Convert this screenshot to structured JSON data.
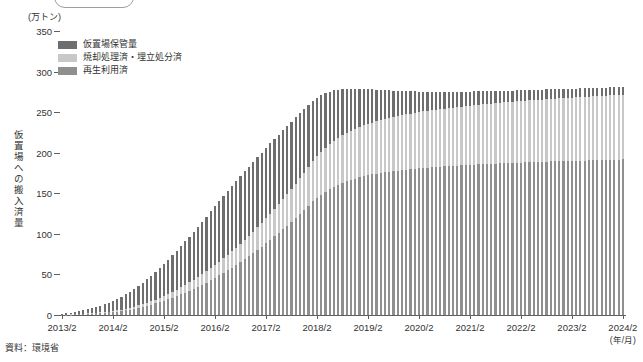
{
  "title_box": {
    "label": ""
  },
  "source_note": "資料：環境省",
  "axes": {
    "y_unit": "(万トン)",
    "y_title": "仮置場への搬入済量",
    "x_unit": "(年/月)",
    "y_ticks": [
      "0",
      "50",
      "100",
      "150",
      "200",
      "250",
      "300",
      "350"
    ],
    "x_ticks": [
      "2013/2",
      "2014/2",
      "2015/2",
      "2016/2",
      "2017/2",
      "2018/2",
      "2019/2",
      "2020/2",
      "2021/2",
      "2022/2",
      "2023/2",
      "2024/2"
    ]
  },
  "legend": {
    "items": [
      {
        "label": "仮置場保管量",
        "color": "#6e6e6e"
      },
      {
        "label": "焼却処理済・埋立処分済",
        "color": "#c8c8c8"
      },
      {
        "label": "再生利用済",
        "color": "#8f8f8f"
      }
    ]
  },
  "colors": {
    "storage": "#6e6e6e",
    "incinerated": "#c8c8c8",
    "recycled": "#8f8f8f",
    "axis": "#5f5f5f",
    "text": "#333333"
  },
  "chart_data": {
    "type": "bar",
    "stacked": true,
    "title": "",
    "xlabel": "(年/月)",
    "ylabel": "仮置場への搬入済量",
    "yunit": "万トン",
    "ylim": [
      0,
      350
    ],
    "ytick_step": 50,
    "grid": false,
    "legend_position": "top-left",
    "categories": [
      "2013/2",
      "2013/3",
      "2013/4",
      "2013/5",
      "2013/6",
      "2013/7",
      "2013/8",
      "2013/9",
      "2013/10",
      "2013/11",
      "2013/12",
      "2014/1",
      "2014/2",
      "2014/3",
      "2014/4",
      "2014/5",
      "2014/6",
      "2014/7",
      "2014/8",
      "2014/9",
      "2014/10",
      "2014/11",
      "2014/12",
      "2015/1",
      "2015/2",
      "2015/3",
      "2015/4",
      "2015/5",
      "2015/6",
      "2015/7",
      "2015/8",
      "2015/9",
      "2015/10",
      "2015/11",
      "2015/12",
      "2016/1",
      "2016/2",
      "2016/3",
      "2016/4",
      "2016/5",
      "2016/6",
      "2016/7",
      "2016/8",
      "2016/9",
      "2016/10",
      "2016/11",
      "2016/12",
      "2017/1",
      "2017/2",
      "2017/3",
      "2017/4",
      "2017/5",
      "2017/6",
      "2017/7",
      "2017/8",
      "2017/9",
      "2017/10",
      "2017/11",
      "2017/12",
      "2018/1",
      "2018/2",
      "2018/3",
      "2018/4",
      "2018/5",
      "2018/6",
      "2018/7",
      "2018/8",
      "2018/9",
      "2018/10",
      "2018/11",
      "2018/12",
      "2019/1",
      "2019/2",
      "2019/3",
      "2019/4",
      "2019/5",
      "2019/6",
      "2019/7",
      "2019/8",
      "2019/9",
      "2019/10",
      "2019/11",
      "2019/12",
      "2020/1",
      "2020/2",
      "2020/3",
      "2020/4",
      "2020/5",
      "2020/6",
      "2020/7",
      "2020/8",
      "2020/9",
      "2020/10",
      "2020/11",
      "2020/12",
      "2021/1",
      "2021/2",
      "2021/3",
      "2021/4",
      "2021/5",
      "2021/6",
      "2021/7",
      "2021/8",
      "2021/9",
      "2021/10",
      "2021/11",
      "2021/12",
      "2022/1",
      "2022/2",
      "2022/3",
      "2022/4",
      "2022/5",
      "2022/6",
      "2022/7",
      "2022/8",
      "2022/9",
      "2022/10",
      "2022/11",
      "2022/12",
      "2023/1",
      "2023/2",
      "2023/3",
      "2023/4",
      "2023/5",
      "2023/6",
      "2023/7",
      "2023/8",
      "2023/9",
      "2023/10",
      "2023/11",
      "2023/12",
      "2024/1",
      "2024/2"
    ],
    "series": [
      {
        "name": "再生利用済",
        "color": "#8f8f8f",
        "values": [
          0.3,
          0.4,
          0.5,
          0.7,
          0.9,
          1.1,
          1.4,
          1.7,
          2.0,
          2.4,
          2.8,
          3.2,
          3.7,
          4.3,
          5.0,
          5.8,
          6.7,
          7.7,
          8.8,
          10.0,
          11.3,
          12.7,
          14.2,
          15.8,
          17.5,
          19.3,
          21.2,
          23.2,
          25.3,
          27.5,
          29.8,
          32.2,
          34.7,
          37.3,
          40.0,
          42.8,
          45.7,
          48.7,
          51.8,
          55.0,
          58.3,
          61.7,
          65.2,
          68.8,
          72.5,
          76.3,
          80.2,
          84.2,
          88.3,
          92.5,
          96.8,
          101.2,
          105.7,
          110.3,
          115.0,
          119.8,
          124.7,
          129.7,
          134.8,
          140.0,
          144.5,
          148.5,
          152.0,
          155.2,
          158.0,
          160.5,
          162.8,
          164.8,
          166.6,
          168.2,
          169.6,
          170.9,
          172.1,
          173.2,
          174.2,
          175.1,
          175.9,
          176.7,
          177.4,
          178.1,
          178.7,
          179.3,
          179.8,
          180.3,
          180.8,
          181.3,
          181.7,
          182.1,
          182.5,
          182.9,
          183.2,
          183.6,
          183.9,
          184.2,
          184.5,
          184.8,
          185.1,
          185.4,
          185.6,
          185.9,
          186.1,
          186.4,
          186.6,
          186.8,
          187.1,
          187.3,
          187.5,
          187.7,
          187.9,
          188.1,
          188.3,
          188.5,
          188.6,
          188.8,
          189.0,
          189.2,
          189.3,
          189.5,
          189.7,
          189.8,
          190.0,
          190.1,
          190.3,
          190.4,
          190.6,
          190.7,
          190.9,
          191.0,
          191.1,
          191.3,
          191.4,
          191.5,
          191.7
        ]
      },
      {
        "name": "焼却処理済・埋立処分済",
        "color": "#c8c8c8",
        "values": [
          0.1,
          0.1,
          0.2,
          0.2,
          0.3,
          0.4,
          0.5,
          0.6,
          0.7,
          0.8,
          1.0,
          1.1,
          1.3,
          1.5,
          1.8,
          2.0,
          2.3,
          2.7,
          3.0,
          3.4,
          3.9,
          4.3,
          4.9,
          5.4,
          6.0,
          6.6,
          7.3,
          8.0,
          8.7,
          9.5,
          10.3,
          11.1,
          12.0,
          12.9,
          13.8,
          14.8,
          15.8,
          16.8,
          17.9,
          19.0,
          20.2,
          21.4,
          22.6,
          23.9,
          25.2,
          26.5,
          27.9,
          29.3,
          30.8,
          32.3,
          33.8,
          35.4,
          37.0,
          38.6,
          40.3,
          42.0,
          43.8,
          45.6,
          47.4,
          49.3,
          51.0,
          52.6,
          54.0,
          55.3,
          56.5,
          57.6,
          58.6,
          59.5,
          60.4,
          61.2,
          62.0,
          62.7,
          63.4,
          64.0,
          64.6,
          65.2,
          65.7,
          66.2,
          66.7,
          67.2,
          67.6,
          68.0,
          68.4,
          68.8,
          69.2,
          69.6,
          69.9,
          70.3,
          70.6,
          70.9,
          71.2,
          71.5,
          71.8,
          72.1,
          72.4,
          72.7,
          72.9,
          73.2,
          73.4,
          73.7,
          73.9,
          74.2,
          74.4,
          74.6,
          74.9,
          75.1,
          75.3,
          75.5,
          75.7,
          75.9,
          76.1,
          76.3,
          76.5,
          76.7,
          76.9,
          77.0,
          77.2,
          77.4,
          77.6,
          77.7,
          77.9,
          78.1,
          78.2,
          78.4,
          78.5,
          78.7,
          78.8,
          79.0,
          79.1,
          79.3,
          79.4,
          79.6,
          79.7
        ]
      },
      {
        "name": "仮置場保管量",
        "color": "#6e6e6e",
        "values": [
          1.1,
          1.5,
          2.0,
          2.6,
          3.3,
          4.1,
          5.0,
          6.0,
          7.1,
          8.3,
          9.6,
          11.0,
          12.5,
          14.1,
          15.9,
          17.8,
          19.8,
          21.9,
          24.1,
          26.4,
          28.8,
          31.3,
          33.9,
          36.6,
          39.3,
          42.1,
          45.0,
          47.9,
          50.8,
          53.7,
          56.6,
          59.4,
          62.2,
          64.9,
          67.5,
          70.0,
          72.4,
          74.6,
          76.7,
          78.6,
          80.3,
          81.8,
          83.1,
          84.2,
          85.1,
          85.8,
          86.3,
          86.6,
          86.7,
          86.6,
          86.3,
          85.8,
          85.1,
          84.2,
          83.1,
          81.8,
          80.3,
          78.6,
          76.7,
          74.6,
          72.3,
          69.9,
          67.4,
          64.8,
          62.2,
          59.6,
          57.0,
          54.5,
          52.0,
          49.6,
          47.3,
          45.1,
          43.0,
          41.0,
          39.1,
          37.3,
          35.6,
          34.0,
          32.5,
          31.1,
          29.8,
          28.6,
          27.5,
          26.4,
          25.4,
          24.5,
          23.6,
          22.8,
          22.0,
          21.3,
          20.6,
          20.0,
          19.4,
          18.8,
          18.3,
          17.8,
          17.3,
          16.9,
          16.5,
          16.1,
          15.7,
          15.4,
          15.0,
          14.7,
          14.4,
          14.1,
          13.9,
          13.6,
          13.4,
          13.1,
          12.9,
          12.7,
          12.5,
          12.3,
          12.1,
          11.9,
          11.7,
          11.5,
          11.4,
          11.2,
          11.0,
          10.9,
          10.7,
          10.6,
          10.5,
          10.3,
          10.2,
          10.1,
          10.0,
          9.9,
          9.8,
          9.7,
          9.6
        ]
      }
    ]
  }
}
